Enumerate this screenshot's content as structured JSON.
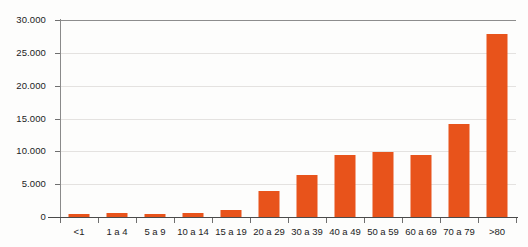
{
  "chart_data": {
    "type": "bar",
    "title": "",
    "subtitle": "",
    "xlabel": "",
    "ylabel": "",
    "ylim": [
      0,
      30000
    ],
    "grid": true,
    "legend": null,
    "bar_color": "#e8531b",
    "categories": [
      "<1",
      "1 a 4",
      "5 a 9",
      "10 a 14",
      "15 a 19",
      "20 a 29",
      "30 a 39",
      "40 a 49",
      "50 a 59",
      "60 a 69",
      "70 a 79",
      ">80"
    ],
    "values": [
      450,
      650,
      450,
      650,
      1000,
      3900,
      6400,
      9400,
      9900,
      9500,
      14200,
      27800
    ],
    "ytick_values": [
      0,
      5000,
      10000,
      15000,
      20000,
      25000,
      30000
    ],
    "ytick_labels": [
      "0",
      "5.000",
      "10.000",
      "15.000",
      "20.000",
      "25.000",
      "30.000"
    ]
  }
}
